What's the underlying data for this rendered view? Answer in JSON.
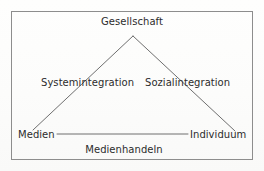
{
  "diagram": {
    "title_label": "Gesellschaft",
    "left_branch_label": "Systemintegration",
    "right_branch_label": "Sozialintegration",
    "left_vertex_label": "Medien",
    "right_vertex_label": "Individuum",
    "base_label": "Medienhandeln",
    "shape": "triangle",
    "colors": {
      "frame": "#8d8d8d",
      "line": "#6f6f6f",
      "text": "#2c2c2c",
      "background": "#fdfdfc"
    },
    "geometry": {
      "frame": {
        "x": 11,
        "y": 11,
        "width": 242,
        "height": 149
      },
      "apex": {
        "x": 133,
        "y": 36
      },
      "left_foot": {
        "x": 33,
        "y": 130
      },
      "right_foot": {
        "x": 235,
        "y": 131
      },
      "base_line": {
        "x1": 57,
        "y1": 134,
        "x2": 188,
        "y2": 134
      }
    }
  }
}
